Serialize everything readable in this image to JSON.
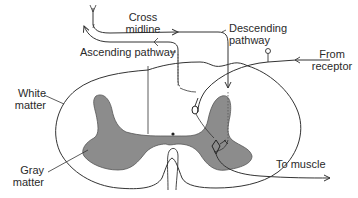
{
  "diagram": {
    "colors": {
      "background": "#ffffff",
      "line": "#333333",
      "gray_matter": "#8c8c8c",
      "text": "#2a2a2a"
    },
    "labels": {
      "cross_midline_1": "Cross",
      "cross_midline_2": "midline",
      "descending_1": "Descending",
      "descending_2": "pathway",
      "ascending": "Ascending pathway",
      "from_receptor_1": "From",
      "from_receptor_2": "receptor",
      "white_matter_1": "White",
      "white_matter_2": "matter",
      "gray_matter_1": "Gray",
      "gray_matter_2": "matter",
      "to_muscle": "To muscle"
    }
  }
}
